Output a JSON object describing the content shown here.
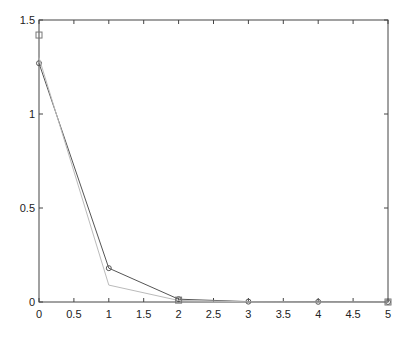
{
  "chart_data": {
    "type": "line",
    "title": "",
    "xlabel": "",
    "ylabel": "",
    "xlim": [
      0,
      5
    ],
    "ylim": [
      0,
      1.5
    ],
    "grid": false,
    "legend": null,
    "x_ticks": [
      "0",
      "0.5",
      "1",
      "1.5",
      "2",
      "2.5",
      "3",
      "3.5",
      "4",
      "4.5",
      "5"
    ],
    "y_ticks": [
      "0",
      "0.5",
      "1",
      "1.5"
    ],
    "series": [
      {
        "name": "dark line with circle markers",
        "color": "#555555",
        "marker": "circle",
        "x": [
          0,
          1,
          2,
          3,
          4,
          5
        ],
        "values": [
          1.27,
          0.18,
          0.015,
          0.002,
          0.001,
          0.0
        ]
      },
      {
        "name": "light line",
        "color": "#bbbbbb",
        "marker": "none",
        "x": [
          0,
          1,
          2,
          3,
          4,
          5
        ],
        "values": [
          1.3,
          0.09,
          0.008,
          0.001,
          0.0,
          0.0
        ]
      },
      {
        "name": "square markers",
        "color": "#777777",
        "marker": "square",
        "x": [
          0,
          2,
          5
        ],
        "values": [
          1.42,
          0.01,
          0.0
        ]
      }
    ]
  }
}
